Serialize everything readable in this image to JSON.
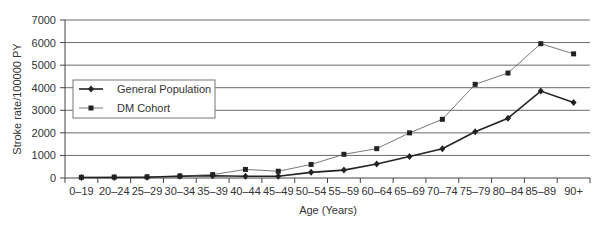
{
  "chart_data": {
    "type": "line",
    "title": "",
    "xlabel": "Age (Years)",
    "ylabel": "Stroke rate/100000 PY",
    "ylim": [
      0,
      7000
    ],
    "yticks": [
      0,
      1000,
      2000,
      3000,
      4000,
      5000,
      6000,
      7000
    ],
    "grid": true,
    "legend_position": "upper-left (inside plot)",
    "categories": [
      "0–19",
      "20–24",
      "25–29",
      "30–34",
      "35–39",
      "40–44",
      "45–49",
      "50–54",
      "55–59",
      "60–64",
      "65–69",
      "70–74",
      "75–79",
      "80–84",
      "85–89",
      "90+"
    ],
    "series": [
      {
        "name": "General Population",
        "marker": "diamond",
        "color": "#222222",
        "line_width": 1.6,
        "values": [
          20,
          25,
          30,
          80,
          100,
          80,
          80,
          250,
          350,
          620,
          950,
          1300,
          2050,
          2650,
          3850,
          3350
        ]
      },
      {
        "name": "DM Cohort",
        "marker": "square",
        "color": "#555555",
        "line_width": 0.8,
        "values": [
          30,
          40,
          50,
          90,
          150,
          380,
          300,
          600,
          1050,
          1300,
          2000,
          2600,
          4150,
          4650,
          5950,
          5500
        ]
      }
    ]
  }
}
